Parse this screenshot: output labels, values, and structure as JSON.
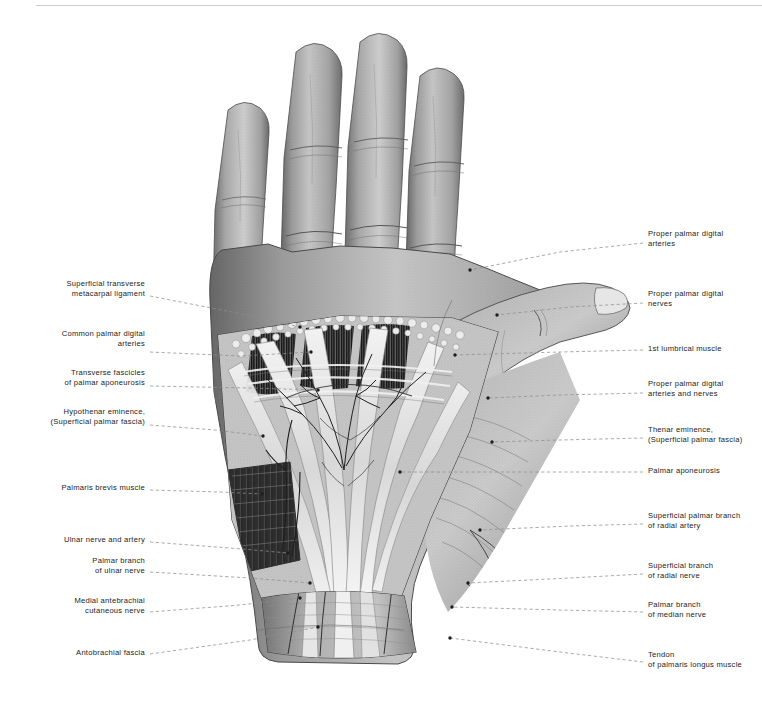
{
  "figure": {
    "style": "grayscale halftone anatomical engraving",
    "background_color": "#ffffff",
    "ink_color": "#1b1b1b",
    "leader_color": "#8d8d8d"
  },
  "labels_left": [
    {
      "id": "superficial-transverse-metacarpal-ligament",
      "lines": [
        "Superficial transverse",
        "metacarpal ligament"
      ],
      "text_x": 145,
      "text_y": 288,
      "leader": [
        [
          150,
          296
        ],
        [
          232,
          312
        ],
        [
          300,
          327
        ]
      ],
      "dot": [
        300,
        327
      ]
    },
    {
      "id": "common-palmar-digital-arteries",
      "lines": [
        "Common palmar digital",
        "arteries"
      ],
      "text_x": 145,
      "text_y": 338,
      "leader": [
        [
          150,
          352
        ],
        [
          240,
          356
        ],
        [
          311,
          352
        ]
      ],
      "dot": [
        311,
        352
      ]
    },
    {
      "id": "transverse-fascicles-of-palmar-aponeurosis",
      "lines": [
        "Transverse fascicles",
        "of palmar aponeurosis"
      ],
      "text_x": 145,
      "text_y": 377,
      "leader": [
        [
          150,
          386
        ],
        [
          250,
          388
        ],
        [
          318,
          390
        ]
      ],
      "dot": [
        318,
        390
      ]
    },
    {
      "id": "hypothenar-eminence-superficial-palmar-fascia",
      "lines": [
        "Hypothenar eminence,",
        "(Superficial palmar fascia)"
      ],
      "text_x": 145,
      "text_y": 416,
      "leader": [
        [
          150,
          425
        ],
        [
          215,
          430
        ],
        [
          263,
          436
        ]
      ],
      "dot": [
        263,
        436
      ]
    },
    {
      "id": "palmaris-brevis-muscle",
      "lines": [
        "Palmaris brevis muscle"
      ],
      "text_x": 145,
      "text_y": 487,
      "leader": [
        [
          150,
          490
        ],
        [
          220,
          492
        ],
        [
          262,
          494
        ]
      ],
      "dot": [
        262,
        494
      ]
    },
    {
      "id": "ulnar-nerve-and-artery",
      "lines": [
        "Ulnar nerve and artery"
      ],
      "text_x": 145,
      "text_y": 539,
      "leader": [
        [
          150,
          542
        ],
        [
          230,
          548
        ],
        [
          288,
          553
        ]
      ],
      "dot": [
        288,
        553
      ]
    },
    {
      "id": "palmar-branch-of-ulnar-nerve",
      "lines": [
        "Palmar branch",
        "of ulnar nerve"
      ],
      "text_x": 145,
      "text_y": 565,
      "leader": [
        [
          150,
          572
        ],
        [
          250,
          578
        ],
        [
          310,
          583
        ]
      ],
      "dot": [
        310,
        583
      ]
    },
    {
      "id": "medial-antebrachial-cutaneous-nerve",
      "lines": [
        "Medial antebrachial",
        "cutaneous nerve"
      ],
      "text_x": 145,
      "text_y": 605,
      "leader": [
        [
          150,
          612
        ],
        [
          240,
          605
        ],
        [
          300,
          598
        ]
      ],
      "dot": [
        300,
        598
      ]
    },
    {
      "id": "antebrachial-fascia",
      "lines": [
        "Antobrachial fascia"
      ],
      "text_x": 145,
      "text_y": 652,
      "leader": [
        [
          150,
          654
        ],
        [
          250,
          640
        ],
        [
          318,
          627
        ]
      ],
      "dot": [
        318,
        627
      ]
    }
  ],
  "labels_right": [
    {
      "id": "proper-palmar-digital-arteries",
      "lines": [
        "Proper palmar digital",
        "arteries"
      ],
      "text_x": 648,
      "text_y": 238,
      "leader": [
        [
          643,
          243
        ],
        [
          560,
          252
        ],
        [
          470,
          270
        ]
      ],
      "dot": [
        470,
        270
      ]
    },
    {
      "id": "proper-palmar-digital-nerves",
      "lines": [
        "Proper palmar digital",
        "nerves"
      ],
      "text_x": 648,
      "text_y": 298,
      "leader": [
        [
          643,
          303
        ],
        [
          570,
          307
        ],
        [
          497,
          315
        ]
      ],
      "dot": [
        497,
        315
      ]
    },
    {
      "id": "1st-lumbrical-muscle",
      "lines": [
        "1st lumbrical muscle"
      ],
      "text_x": 648,
      "text_y": 348,
      "leader": [
        [
          643,
          350
        ],
        [
          560,
          352
        ],
        [
          455,
          355
        ]
      ],
      "dot": [
        455,
        355
      ]
    },
    {
      "id": "proper-palmar-digital-arteries-and-nerves",
      "lines": [
        "Proper palmar digital",
        "arteries and nerves"
      ],
      "text_x": 648,
      "text_y": 388,
      "leader": [
        [
          643,
          393
        ],
        [
          560,
          395
        ],
        [
          488,
          398
        ]
      ],
      "dot": [
        488,
        398
      ]
    },
    {
      "id": "thenar-eminence-superficial-palmar-fascia",
      "lines": [
        "Thenar eminence,",
        "(Superficial palmar fascia)"
      ],
      "text_x": 648,
      "text_y": 434,
      "leader": [
        [
          643,
          438
        ],
        [
          560,
          440
        ],
        [
          492,
          442
        ]
      ],
      "dot": [
        492,
        442
      ]
    },
    {
      "id": "palmar-aponeurosis",
      "lines": [
        "Palmar aponeurosis"
      ],
      "text_x": 648,
      "text_y": 470,
      "leader": [
        [
          643,
          472
        ],
        [
          560,
          472
        ],
        [
          400,
          472
        ]
      ],
      "dot": [
        400,
        472
      ]
    },
    {
      "id": "superficial-palmar-branch-of-radial-artery",
      "lines": [
        "Superficial palmar branch",
        "of radial artery"
      ],
      "text_x": 648,
      "text_y": 520,
      "leader": [
        [
          643,
          524
        ],
        [
          570,
          526
        ],
        [
          480,
          530
        ]
      ],
      "dot": [
        480,
        530
      ]
    },
    {
      "id": "superficial-branch-of-radial-nerve",
      "lines": [
        "Superficial branch",
        "of radial nerve"
      ],
      "text_x": 648,
      "text_y": 570,
      "leader": [
        [
          643,
          574
        ],
        [
          570,
          578
        ],
        [
          468,
          583
        ]
      ],
      "dot": [
        468,
        583
      ]
    },
    {
      "id": "palmar-branch-of-median-nerve",
      "lines": [
        "Palmar branch",
        "of median nerve"
      ],
      "text_x": 648,
      "text_y": 609,
      "leader": [
        [
          643,
          612
        ],
        [
          560,
          610
        ],
        [
          452,
          607
        ]
      ],
      "dot": [
        452,
        607
      ]
    },
    {
      "id": "tendon-of-palmaris-longus-muscle",
      "lines": [
        "Tendon",
        "of palmaris longus muscle"
      ],
      "text_x": 648,
      "text_y": 659,
      "leader": [
        [
          643,
          662
        ],
        [
          560,
          652
        ],
        [
          450,
          638
        ]
      ],
      "dot": [
        450,
        638
      ]
    }
  ]
}
